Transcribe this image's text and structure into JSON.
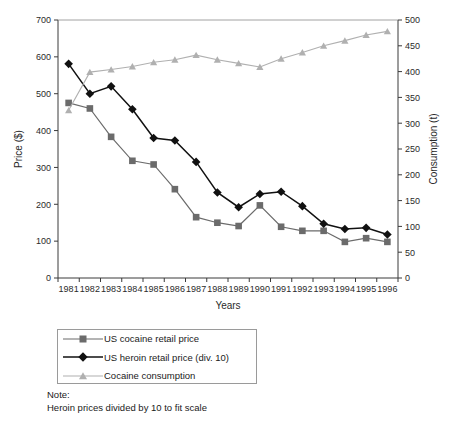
{
  "chart_data": {
    "type": "line",
    "title": "",
    "xlabel": "Years",
    "ylabel": "Price ($)",
    "y2label": "Consumption (t)",
    "categories": [
      "1981",
      "1982",
      "1983",
      "1984",
      "1985",
      "1986",
      "1987",
      "1988",
      "1989",
      "1990",
      "1991",
      "1992",
      "1993",
      "1994",
      "1995",
      "1996"
    ],
    "xticklabels": [
      "1981",
      "1982",
      "1983",
      "1984",
      "1985",
      "1986",
      "1987",
      "1988",
      "1989",
      "1990",
      "1991",
      "1992",
      "1993",
      "1994",
      "1995",
      "1996"
    ],
    "yticklabels": [
      "0",
      "100",
      "200",
      "300",
      "400",
      "500",
      "600",
      "700"
    ],
    "y2ticklabels": [
      "0",
      "50",
      "100",
      "150",
      "200",
      "250",
      "300",
      "350",
      "400",
      "450",
      "500"
    ],
    "ylim": [
      0,
      700
    ],
    "y2lim": [
      0,
      500
    ],
    "grid": false,
    "legend_position": "below-left",
    "series": [
      {
        "name": "US cocaine retail price",
        "axis": "left",
        "marker": "square",
        "color": "#6b6b6b",
        "values": [
          475,
          460,
          383,
          318,
          308,
          241,
          165,
          150,
          141,
          197,
          139,
          128,
          128,
          98,
          108,
          98
        ]
      },
      {
        "name": "US heroin retail price (div. 10)",
        "axis": "left",
        "marker": "diamond",
        "color": "#111111",
        "values": [
          581,
          500,
          520,
          458,
          380,
          373,
          315,
          232,
          192,
          228,
          234,
          195,
          147,
          133,
          136,
          118
        ]
      },
      {
        "name": "Cocaine consumption",
        "axis": "right",
        "marker": "triangle",
        "color": "#b0b0b0",
        "values": [
          325,
          399,
          404,
          410,
          418,
          423,
          432,
          423,
          416,
          409,
          425,
          437,
          450,
          460,
          471,
          478
        ]
      }
    ]
  },
  "legend": {
    "items": [
      {
        "label": "US cocaine retail price",
        "marker": "square-marker",
        "color": "#6b6b6b"
      },
      {
        "label": "US heroin retail price (div. 10)",
        "marker": "diamond-marker",
        "color": "#111111"
      },
      {
        "label": "Cocaine consumption",
        "marker": "triangle-marker",
        "color": "#b0b0b0"
      }
    ]
  },
  "note": {
    "heading": "Note:",
    "text": "Heroin prices divided by 10 to fit scale"
  }
}
